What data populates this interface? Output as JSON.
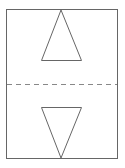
{
  "diagram": {
    "width": 125,
    "height": 168,
    "background": "#ffffff",
    "stroke_color": "#666666",
    "dash_color": "#888888",
    "rectangle": {
      "x": 6.5,
      "y": 9.5,
      "width": 111,
      "height": 149
    },
    "fold_line": {
      "x1": 7,
      "y1": 84.5,
      "x2": 117,
      "y2": 84.5,
      "dash": "5,4"
    },
    "top_triangle": {
      "points": "61,10 41.5,60.5 81.5,60.5",
      "direction": "up"
    },
    "bottom_triangle": {
      "points": "41.5,107.5 81.5,107.5 61,158",
      "direction": "down"
    }
  }
}
